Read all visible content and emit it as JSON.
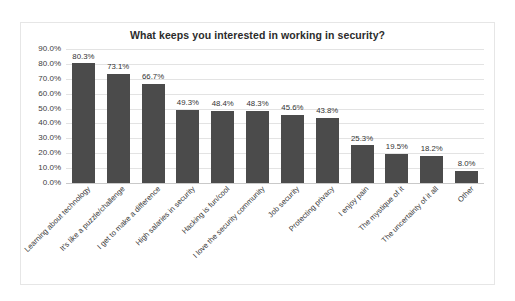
{
  "chart": {
    "title": "What keeps you interested in working in security?"
  },
  "chart_data": {
    "type": "bar",
    "title": "What keeps you interested in working in security?",
    "xlabel": "",
    "ylabel": "",
    "ylim": [
      0,
      90
    ],
    "grid": true,
    "legend": "none",
    "orientation": "vertical",
    "bar_color": "#4b4b4b",
    "value_suffix": "%",
    "ytick_labels": [
      "90.0%",
      "80.0%",
      "70.0%",
      "60.0%",
      "50.0%",
      "40.0%",
      "30.0%",
      "20.0%",
      "10.0%",
      "0.0%"
    ],
    "ytick_values": [
      90,
      80,
      70,
      60,
      50,
      40,
      30,
      20,
      10,
      0
    ],
    "categories": [
      "Learning about technology",
      "It's like a puzzle/challenge",
      "I get to make a difference",
      "High salaries in security",
      "Hacking is fun/cool",
      "I love the security community",
      "Job security",
      "Protecting privacy",
      "I enjoy pain",
      "The mystique of it",
      "The uncertainty of it all",
      "Other"
    ],
    "values": [
      80.3,
      73.1,
      66.7,
      49.3,
      48.4,
      48.3,
      45.6,
      43.8,
      25.3,
      19.5,
      18.2,
      8.0
    ],
    "data_labels": [
      "80.3%",
      "73.1%",
      "66.7%",
      "49.3%",
      "48.4%",
      "48.3%",
      "45.6%",
      "43.8%",
      "25.3%",
      "19.5%",
      "18.2%",
      "8.0%"
    ]
  }
}
